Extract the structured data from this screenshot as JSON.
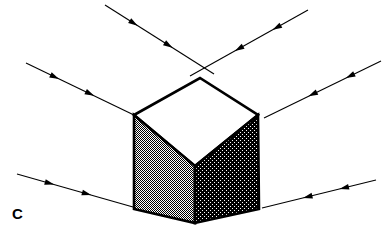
{
  "figure": {
    "panel_label": "C",
    "background_color": "#ffffff",
    "stroke_color": "#000000",
    "canvas": {
      "width": 391,
      "height": 242
    }
  },
  "cube": {
    "name": "shaded-isometric-cube",
    "outline_color": "#000000",
    "outline_width": 2.6,
    "vertices": {
      "top_left": [
        134,
        115
      ],
      "top_apex": [
        200,
        78
      ],
      "top_right": [
        258,
        115
      ],
      "top_front": [
        195,
        166
      ],
      "bottom_left": [
        134,
        209
      ],
      "bottom_center": [
        195,
        223
      ],
      "bottom_right": [
        259,
        209
      ]
    },
    "faces": [
      {
        "name": "top-face",
        "fill_label": "white",
        "fill_color": "#ffffff",
        "points": "134,115 200,78 258,115 195,166"
      },
      {
        "name": "left-face",
        "fill_label": "medium-gray-dither",
        "fill_color": "#a6a6a6",
        "points": "134,115 195,166 195,223 134,209"
      },
      {
        "name": "right-face",
        "fill_label": "dark-gray-dither",
        "fill_color": "#585858",
        "points": "195,166 258,115 259,209 195,223"
      }
    ]
  },
  "rays": {
    "arrowhead_color": "#000000",
    "line_width": 1.1,
    "items": [
      {
        "name": "ray-upper-left",
        "direction": "down-right",
        "x1": 105,
        "y1": 5,
        "x2": 214,
        "y2": 74,
        "arrow_positions": [
          0.3,
          0.62
        ]
      },
      {
        "name": "ray-upper-right",
        "direction": "down-left",
        "x1": 308,
        "y1": 10,
        "x2": 190,
        "y2": 76,
        "arrow_positions": [
          0.3,
          0.62
        ]
      },
      {
        "name": "ray-middle-left",
        "direction": "down-right",
        "x1": 26,
        "y1": 63,
        "x2": 136,
        "y2": 116,
        "arrow_positions": [
          0.3,
          0.62
        ]
      },
      {
        "name": "ray-middle-right",
        "direction": "down-left",
        "x1": 381,
        "y1": 61,
        "x2": 264,
        "y2": 118,
        "arrow_positions": [
          0.3,
          0.62
        ]
      },
      {
        "name": "ray-lower-left",
        "direction": "down-right",
        "x1": 17,
        "y1": 174,
        "x2": 133,
        "y2": 207,
        "arrow_positions": [
          0.32,
          0.64
        ]
      },
      {
        "name": "ray-lower-right",
        "direction": "down-left",
        "x1": 376,
        "y1": 180,
        "x2": 262,
        "y2": 208,
        "arrow_positions": [
          0.32,
          0.64
        ]
      }
    ]
  }
}
